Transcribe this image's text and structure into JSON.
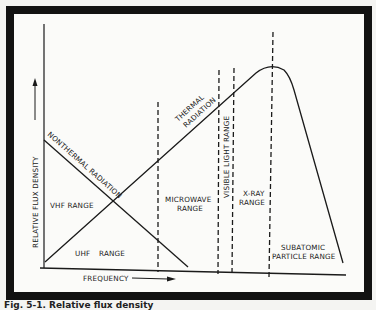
{
  "figure": {
    "caption": "Fig. 5-1. Relative flux density",
    "axes": {
      "x_label": "FREQUENCY",
      "y_label": "RELATIVE FLUX DENSITY"
    },
    "curves": {
      "nonthermal": "NONTHERMAL RADIATION",
      "thermal_line1": "THERMAL",
      "thermal_line2": "RADIATION"
    },
    "regions": {
      "vhf": "VHF RANGE",
      "uhf_1": "UHF",
      "uhf_2": "RANGE",
      "microwave_1": "MICROWAVE",
      "microwave_2": "RANGE",
      "visible": "VISIBLE LIGHT RANGE",
      "xray_1": "X-RAY",
      "xray_2": "RANGE",
      "subatomic_1": "SUBATOMIC",
      "subatomic_2": "PARTICLE RANGE"
    },
    "colors": {
      "ink": "#1a1a1a",
      "frame": "#121212",
      "paper": "#fbfbf9"
    }
  }
}
